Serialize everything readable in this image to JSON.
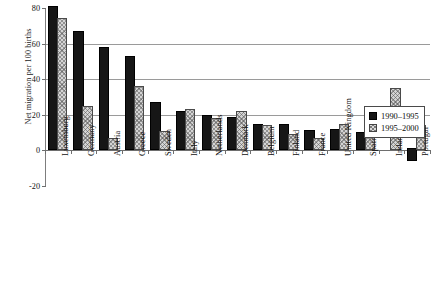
{
  "chart_data": {
    "type": "bar",
    "title": "",
    "subtitle": "",
    "xlabel": "",
    "ylabel": "Net migration per 100 births",
    "ylim": [
      -20,
      80
    ],
    "yticks": [
      80,
      60,
      40,
      20,
      0,
      -20
    ],
    "ytick_labels": [
      "80",
      "60",
      "40",
      "20",
      "0",
      "-20"
    ],
    "grid": "horizontal gridlines at 60, 40, 20 and zero line at 0",
    "legend_position": "right, inside plot area",
    "categories": [
      "Luxemburg",
      "Germany",
      "Austria",
      "Greece",
      "Sweden",
      "Italy",
      "Netherlands",
      "Denmark",
      "Belgium",
      "Finland",
      "France",
      "United Kingdom",
      "Spain",
      "Ireland",
      "Portugal"
    ],
    "series": [
      {
        "name": "1990–1995",
        "style": "solid-black",
        "values": [
          80,
          66,
          57,
          52,
          26,
          21,
          19,
          17.5,
          14,
          13.5,
          10.5,
          11,
          9.5,
          0,
          -6
        ]
      },
      {
        "name": "1995–2000",
        "style": "grey-hatched",
        "values": [
          73,
          24,
          6,
          35,
          10,
          22,
          17,
          21,
          13,
          8,
          6,
          14,
          11,
          34,
          13
        ]
      }
    ]
  },
  "legend": {
    "entries": [
      {
        "label": "1990–1995",
        "swatch": "dark-square-icon"
      },
      {
        "label": "1995–2000",
        "swatch": "hatched-square-icon"
      }
    ]
  },
  "axis": {
    "y_title": "Net migration per 100 births"
  },
  "caption": {
    "text": ""
  },
  "colors": {
    "series_1990_1995": "#161616",
    "series_1995_2000": "#d4d4d4",
    "gridline": "#9a9a9a",
    "axis": "#6e6e6e",
    "background": "#ffffff"
  }
}
